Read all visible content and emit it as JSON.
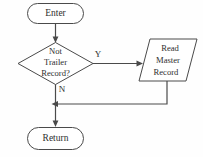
{
  "diagram": {
    "background_color": "#fefefe",
    "stroke_color": "#4a4a4a",
    "text_color": "#2e2e2e",
    "nodes": {
      "enter": {
        "shape": "terminator",
        "label": "Enter"
      },
      "decision": {
        "shape": "diamond",
        "line1": "Not",
        "line2": "Trailer",
        "line3": "Record?"
      },
      "read": {
        "shape": "parallelogram",
        "line1": "Read",
        "line2": "Master",
        "line3": "Record"
      },
      "return": {
        "shape": "terminator",
        "label": "Return"
      }
    },
    "edges": {
      "enter_to_decision": {
        "label": ""
      },
      "decision_yes": {
        "label": "Y"
      },
      "decision_no": {
        "label": "N"
      },
      "read_feedback": {
        "label": ""
      },
      "no_to_return": {
        "label": ""
      }
    }
  }
}
